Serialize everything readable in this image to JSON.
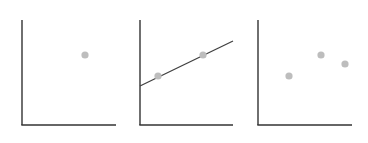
{
  "chart_data": [
    {
      "type": "scatter",
      "title": "",
      "xlabel": "",
      "ylabel": "",
      "grid": false,
      "axis": {
        "origin": [
          22,
          125
        ],
        "x_end": 116,
        "y_top": 20
      },
      "points": [
        {
          "x": 85,
          "y": 55
        }
      ],
      "fit_line": null
    },
    {
      "type": "scatter",
      "title": "",
      "xlabel": "",
      "ylabel": "",
      "grid": false,
      "axis": {
        "origin": [
          140,
          125
        ],
        "x_end": 233,
        "y_top": 20
      },
      "points": [
        {
          "x": 158,
          "y": 76
        },
        {
          "x": 203,
          "y": 55
        }
      ],
      "fit_line": {
        "x1": 140,
        "y1": 86,
        "x2": 233,
        "y2": 41
      }
    },
    {
      "type": "scatter",
      "title": "",
      "xlabel": "",
      "ylabel": "",
      "grid": false,
      "axis": {
        "origin": [
          258,
          125
        ],
        "x_end": 352,
        "y_top": 20
      },
      "points": [
        {
          "x": 289,
          "y": 76
        },
        {
          "x": 321,
          "y": 55
        },
        {
          "x": 345,
          "y": 64
        }
      ],
      "fit_line": null
    }
  ],
  "colors": {
    "axis": "#333333",
    "point": "#bdbdbd",
    "line": "#404040"
  }
}
